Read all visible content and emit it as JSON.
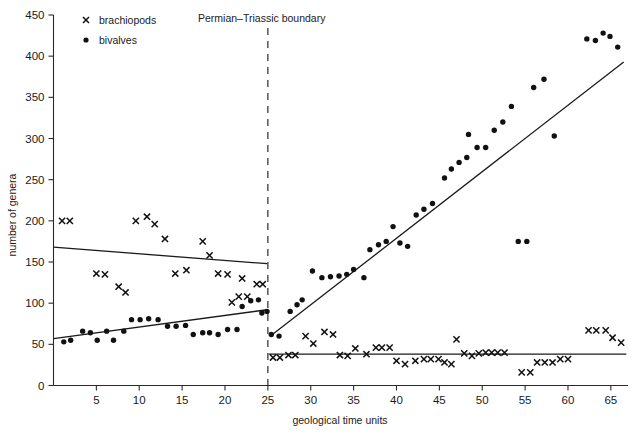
{
  "chart_data": {
    "type": "scatter",
    "title": "",
    "xlabel": "geological time units",
    "ylabel": "number of genera",
    "xlim": [
      0,
      67
    ],
    "ylim": [
      0,
      450
    ],
    "grid": false,
    "legend_position": "top-left",
    "xticks": [
      5,
      10,
      15,
      20,
      25,
      30,
      35,
      40,
      45,
      50,
      55,
      60,
      65
    ],
    "yticks": [
      0,
      50,
      100,
      150,
      200,
      250,
      300,
      350,
      400,
      450
    ],
    "annotations": [
      {
        "text": "Permian–Triassic boundary",
        "x": 25,
        "type": "vertical-dashed-line-label"
      }
    ],
    "boundary_x": 25,
    "series": [
      {
        "name": "brachiopods",
        "marker": "x",
        "points": [
          [
            1.0,
            200
          ],
          [
            1.9,
            200
          ],
          [
            5.0,
            136
          ],
          [
            6.0,
            135
          ],
          [
            7.6,
            120
          ],
          [
            8.4,
            113
          ],
          [
            9.6,
            200
          ],
          [
            10.9,
            205
          ],
          [
            11.8,
            196
          ],
          [
            13.0,
            178
          ],
          [
            14.2,
            136
          ],
          [
            15.5,
            140
          ],
          [
            17.4,
            175
          ],
          [
            18.2,
            158
          ],
          [
            19.2,
            136
          ],
          [
            20.3,
            135
          ],
          [
            21.6,
            108
          ],
          [
            22.6,
            108
          ],
          [
            22.0,
            130
          ],
          [
            20.8,
            101
          ],
          [
            23.7,
            123
          ],
          [
            24.4,
            123
          ],
          [
            25.6,
            34
          ],
          [
            26.4,
            34
          ],
          [
            27.4,
            37
          ],
          [
            28.2,
            37
          ],
          [
            29.4,
            60
          ],
          [
            30.3,
            51
          ],
          [
            31.6,
            65
          ],
          [
            32.6,
            62
          ],
          [
            33.4,
            37
          ],
          [
            34.3,
            36
          ],
          [
            35.2,
            45
          ],
          [
            36.5,
            38
          ],
          [
            37.6,
            46
          ],
          [
            38.3,
            46
          ],
          [
            39.2,
            46
          ],
          [
            40.0,
            30
          ],
          [
            41.0,
            26
          ],
          [
            42.2,
            30
          ],
          [
            43.2,
            32
          ],
          [
            44.0,
            32
          ],
          [
            44.9,
            32
          ],
          [
            45.6,
            28
          ],
          [
            46.4,
            26
          ],
          [
            47.0,
            56
          ],
          [
            47.9,
            39
          ],
          [
            48.8,
            36
          ],
          [
            49.6,
            39
          ],
          [
            50.4,
            40
          ],
          [
            51.1,
            40
          ],
          [
            51.8,
            40
          ],
          [
            52.6,
            40
          ],
          [
            54.6,
            16
          ],
          [
            55.6,
            16
          ],
          [
            56.4,
            28
          ],
          [
            57.3,
            28
          ],
          [
            58.2,
            28
          ],
          [
            59.1,
            32
          ],
          [
            60.0,
            32
          ],
          [
            62.4,
            67
          ],
          [
            63.3,
            67
          ],
          [
            64.4,
            67
          ],
          [
            65.2,
            58
          ],
          [
            66.2,
            52
          ]
        ]
      },
      {
        "name": "bivalves",
        "marker": "dot",
        "points": [
          [
            1.2,
            53
          ],
          [
            2.0,
            55
          ],
          [
            3.4,
            66
          ],
          [
            4.3,
            64
          ],
          [
            5.1,
            55
          ],
          [
            6.2,
            66
          ],
          [
            7.0,
            55
          ],
          [
            8.2,
            66
          ],
          [
            9.1,
            80
          ],
          [
            10.1,
            80
          ],
          [
            11.1,
            81
          ],
          [
            12.2,
            80
          ],
          [
            13.3,
            72
          ],
          [
            14.3,
            72
          ],
          [
            15.4,
            73
          ],
          [
            16.3,
            62
          ],
          [
            17.4,
            64
          ],
          [
            18.2,
            64
          ],
          [
            19.2,
            62
          ],
          [
            20.3,
            68
          ],
          [
            21.4,
            68
          ],
          [
            22.0,
            96
          ],
          [
            23.0,
            103
          ],
          [
            23.9,
            104
          ],
          [
            24.3,
            88
          ],
          [
            24.9,
            90
          ],
          [
            25.4,
            62
          ],
          [
            26.3,
            60
          ],
          [
            27.6,
            90
          ],
          [
            28.4,
            98
          ],
          [
            29.0,
            104
          ],
          [
            30.2,
            139
          ],
          [
            31.3,
            131
          ],
          [
            32.3,
            132
          ],
          [
            33.3,
            133
          ],
          [
            34.2,
            135
          ],
          [
            35.0,
            141
          ],
          [
            36.2,
            131
          ],
          [
            36.9,
            165
          ],
          [
            37.9,
            171
          ],
          [
            38.8,
            175
          ],
          [
            39.6,
            193
          ],
          [
            40.4,
            173
          ],
          [
            41.3,
            169
          ],
          [
            42.3,
            207
          ],
          [
            43.2,
            214
          ],
          [
            44.2,
            221
          ],
          [
            45.6,
            252
          ],
          [
            46.4,
            263
          ],
          [
            47.3,
            271
          ],
          [
            48.2,
            277
          ],
          [
            48.4,
            305
          ],
          [
            49.4,
            289
          ],
          [
            50.4,
            289
          ],
          [
            51.4,
            310
          ],
          [
            52.4,
            320
          ],
          [
            53.4,
            339
          ],
          [
            54.2,
            175
          ],
          [
            55.2,
            175
          ],
          [
            56.0,
            362
          ],
          [
            57.2,
            372
          ],
          [
            58.4,
            303
          ],
          [
            62.2,
            421
          ],
          [
            63.2,
            419
          ],
          [
            64.1,
            428
          ],
          [
            64.9,
            424
          ],
          [
            65.8,
            411
          ]
        ]
      }
    ],
    "trend_lines": [
      {
        "name": "brachiopods-pre-boundary",
        "x0": 0.0,
        "y0": 168,
        "x1": 24.9,
        "y1": 148
      },
      {
        "name": "bivalves-pre-boundary",
        "x0": 0.0,
        "y0": 57,
        "x1": 24.9,
        "y1": 92
      },
      {
        "name": "bivalves-post-boundary",
        "x0": 25.3,
        "y0": 60,
        "x1": 66.5,
        "y1": 393
      },
      {
        "name": "brachiopods-post-boundary",
        "x0": 25.1,
        "y0": 38,
        "x1": 66.8,
        "y1": 38
      }
    ]
  },
  "legend": {
    "items": [
      {
        "label": "brachiopods",
        "marker": "x-marker-icon"
      },
      {
        "label": "bivalves",
        "marker": "dot-marker-icon"
      }
    ]
  },
  "axes": {
    "x_title": "geological time units",
    "y_title": "number of genera"
  }
}
